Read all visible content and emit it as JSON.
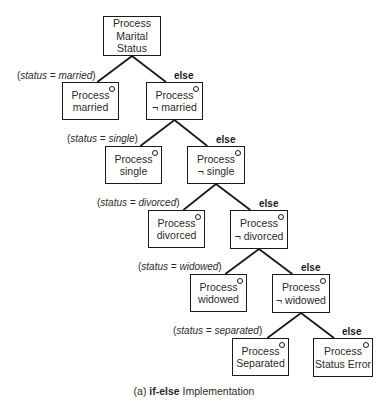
{
  "diagram": {
    "type": "decision-tree",
    "caption": {
      "prefix": "(a) ",
      "keyword": "if-else",
      "suffix": " Implementation"
    },
    "nodes": [
      {
        "id": "root",
        "lines": [
          "Process",
          "Marital",
          "Status"
        ],
        "x": 103,
        "y": 16,
        "w": 58,
        "h": 40,
        "marker": false
      },
      {
        "id": "married",
        "lines": [
          "Process",
          "married"
        ],
        "x": 62,
        "y": 82,
        "w": 57,
        "h": 38,
        "marker": true
      },
      {
        "id": "not-married",
        "lines": [
          "Process",
          "¬ married"
        ],
        "x": 146,
        "y": 82,
        "w": 57,
        "h": 38,
        "marker": true
      },
      {
        "id": "single",
        "lines": [
          "Process",
          "single"
        ],
        "x": 105,
        "y": 146,
        "w": 57,
        "h": 38,
        "marker": true
      },
      {
        "id": "not-single",
        "lines": [
          "Process",
          "¬ single"
        ],
        "x": 187,
        "y": 146,
        "w": 58,
        "h": 38,
        "marker": true
      },
      {
        "id": "divorced",
        "lines": [
          "Process",
          "divorced"
        ],
        "x": 148,
        "y": 210,
        "w": 57,
        "h": 38,
        "marker": true
      },
      {
        "id": "not-divorced",
        "lines": [
          "Process",
          "¬ divorced"
        ],
        "x": 230,
        "y": 210,
        "w": 58,
        "h": 39,
        "marker": true
      },
      {
        "id": "widowed",
        "lines": [
          "Process",
          "widowed"
        ],
        "x": 190,
        "y": 274,
        "w": 57,
        "h": 38,
        "marker": true
      },
      {
        "id": "not-widowed",
        "lines": [
          "Process",
          "¬ widowed"
        ],
        "x": 272,
        "y": 274,
        "w": 58,
        "h": 39,
        "marker": true
      },
      {
        "id": "separated",
        "lines": [
          "Process",
          "Separated"
        ],
        "x": 232,
        "y": 338,
        "w": 57,
        "h": 38,
        "marker": true
      },
      {
        "id": "status-error",
        "lines": [
          "Process",
          "Status Error"
        ],
        "x": 313,
        "y": 338,
        "w": 60,
        "h": 39,
        "marker": true
      }
    ],
    "edges": [
      {
        "from": "root",
        "to": "married",
        "label_type": "condition",
        "variable": "status",
        "value": "married",
        "label_x": 17,
        "label_y": 70
      },
      {
        "from": "root",
        "to": "not-married",
        "label_type": "else",
        "label": "else",
        "label_x": 174,
        "label_y": 70
      },
      {
        "from": "not-married",
        "to": "single",
        "label_type": "condition",
        "variable": "status",
        "value": "single",
        "label_x": 67,
        "label_y": 133
      },
      {
        "from": "not-married",
        "to": "not-single",
        "label_type": "else",
        "label": "else",
        "label_x": 216,
        "label_y": 134
      },
      {
        "from": "not-single",
        "to": "divorced",
        "label_type": "condition",
        "variable": "status",
        "value": "divorced",
        "label_x": 97,
        "label_y": 197
      },
      {
        "from": "not-single",
        "to": "not-divorced",
        "label_type": "else",
        "label": "else",
        "label_x": 259,
        "label_y": 198
      },
      {
        "from": "not-divorced",
        "to": "widowed",
        "label_type": "condition",
        "variable": "status",
        "value": "widowed",
        "label_x": 138,
        "label_y": 261
      },
      {
        "from": "not-divorced",
        "to": "not-widowed",
        "label_type": "else",
        "label": "else",
        "label_x": 301,
        "label_y": 262
      },
      {
        "from": "not-widowed",
        "to": "separated",
        "label_type": "condition",
        "variable": "status",
        "value": "separated",
        "label_x": 173,
        "label_y": 325
      },
      {
        "from": "not-widowed",
        "to": "status-error",
        "label_type": "else",
        "label": "else",
        "label_x": 342,
        "label_y": 326
      }
    ]
  }
}
